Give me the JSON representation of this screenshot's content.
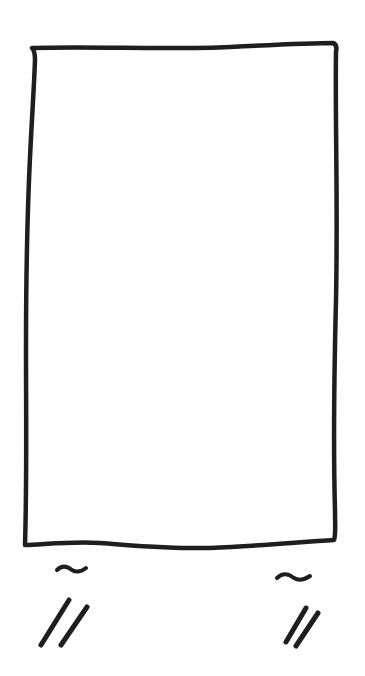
{
  "sketch": {
    "background": "#ffffff",
    "stroke_color": "#1e1e1e",
    "shapes": [
      {
        "type": "rectangle",
        "description": "tall hand-drawn rectangle outline",
        "approx_bounds": {
          "x": 25,
          "y": 42,
          "width": 313,
          "height": 505
        }
      },
      {
        "type": "tilde",
        "position": "below-left",
        "approx_center": {
          "x": 70,
          "y": 572
        }
      },
      {
        "type": "tilde",
        "position": "below-right",
        "approx_center": {
          "x": 295,
          "y": 578
        }
      },
      {
        "type": "double-slash",
        "position": "below-left",
        "approx_center": {
          "x": 64,
          "y": 622
        }
      },
      {
        "type": "double-slash",
        "position": "below-right",
        "approx_center": {
          "x": 300,
          "y": 628
        }
      }
    ]
  }
}
